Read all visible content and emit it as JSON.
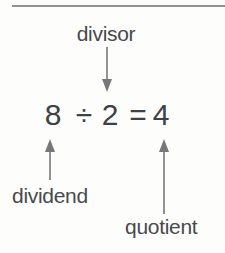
{
  "diagram": {
    "equation": {
      "dividend": "8",
      "operator": "÷",
      "divisor": "2",
      "equals": "=",
      "quotient": "4",
      "full": "8 ÷ 2 = 4"
    },
    "labels": {
      "divisor": "divisor",
      "dividend": "dividend",
      "quotient": "quotient"
    },
    "colors": {
      "text": "#47494b",
      "equation_text": "#3f4244",
      "arrow": "#76787a",
      "rule": "#929292",
      "background": "#fdfdfc"
    }
  }
}
